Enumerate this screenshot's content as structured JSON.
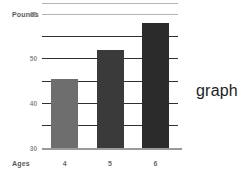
{
  "annotation": {
    "label": "graph"
  },
  "chart_data": {
    "type": "bar",
    "title": "",
    "xlabel": "Ages",
    "ylabel": "Pounds",
    "categories": [
      "4",
      "5",
      "6"
    ],
    "values": [
      31,
      44,
      56
    ],
    "ylim": [
      0,
      60
    ],
    "yticks": [
      0,
      10,
      20,
      30,
      40,
      50,
      60
    ],
    "ytick_labels": [
      "0",
      "10",
      "20",
      "30",
      "40",
      "50",
      "60"
    ],
    "grid": true,
    "legend": false,
    "bar_colors": [
      "#6e6e6e",
      "#3a3a3a",
      "#2b2b2b"
    ],
    "gridline_color": "#2f2f2f",
    "top_rule_color": "#b4b4b4",
    "baseline_color": "#9a9a9a"
  }
}
